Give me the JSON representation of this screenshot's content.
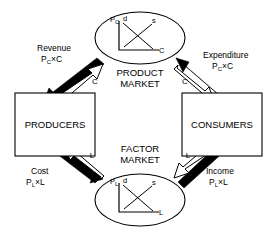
{
  "diagram": {
    "type": "economics-circular-flow",
    "nodes": {
      "producers": {
        "label": "PRODUCERS"
      },
      "consumers": {
        "label": "CONSUMERS"
      },
      "product_market": {
        "label_line1": "PRODUCT",
        "label_line2": "MARKET"
      },
      "factor_market": {
        "label_line1": "FACTOR",
        "label_line2": "MARKET"
      }
    },
    "flows": {
      "revenue": {
        "label": "Revenue",
        "formula_p": "P",
        "formula_sub": "C",
        "formula_rest": "×C",
        "direction": "product-market-to-producers",
        "style": "solid"
      },
      "expenditure": {
        "label": "Expenditure",
        "formula_p": "P",
        "formula_sub": "C",
        "formula_rest": "×C",
        "direction": "consumers-to-product-market",
        "style": "solid"
      },
      "cost": {
        "label": "Cost",
        "formula_p": "P",
        "formula_sub": "L",
        "formula_rest": "×L",
        "direction": "producers-to-factor-market",
        "style": "solid"
      },
      "income": {
        "label": "Income",
        "formula_p": "P",
        "formula_sub": "L",
        "formula_rest": "×L",
        "direction": "factor-market-to-consumers",
        "style": "solid"
      },
      "goods_supplied": {
        "label": "C",
        "direction": "producers-to-product-market",
        "style": "hollow"
      },
      "goods_received": {
        "label": "C",
        "direction": "product-market-to-consumers",
        "style": "hollow"
      },
      "labor_received": {
        "label": "L",
        "direction": "factor-market-to-producers",
        "style": "hollow"
      },
      "labor_supplied": {
        "label": "L",
        "direction": "consumers-to-factor-market",
        "style": "hollow"
      }
    },
    "product_market_chart": {
      "y_axis_label": "P",
      "y_axis_sub": "C",
      "x_axis_label": "C",
      "demand_label": "d",
      "supply_label": "s"
    },
    "factor_market_chart": {
      "y_axis_label": "P",
      "y_axis_sub": "L",
      "x_axis_label": "L",
      "demand_label": "d",
      "supply_label": "s"
    },
    "colors": {
      "stroke": "#000000",
      "fill": "#ffffff",
      "solid_arrow": "#000000",
      "hollow_arrow": "#ffffff"
    }
  }
}
